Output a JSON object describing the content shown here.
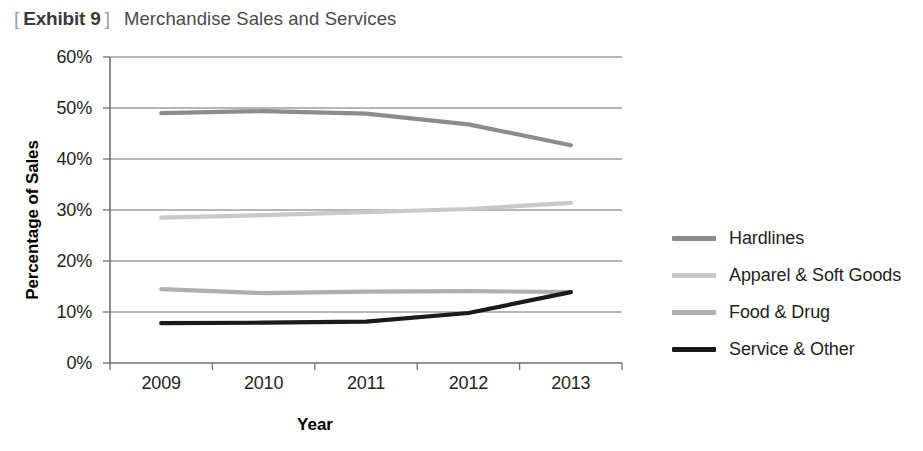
{
  "header": {
    "bracket_open": "[",
    "bracket_close": "]",
    "exhibit_label": "Exhibit 9",
    "title": "Merchandise Sales and Services"
  },
  "chart_data": {
    "type": "line",
    "title": "Merchandise Sales and Services",
    "xlabel": "Year",
    "ylabel": "Percentage of Sales",
    "categories": [
      "2009",
      "2010",
      "2011",
      "2012",
      "2013"
    ],
    "x_tick_labels": [
      "2009",
      "2010",
      "2011",
      "2012",
      "2013"
    ],
    "y_tick_labels": [
      "0%",
      "10%",
      "20%",
      "30%",
      "40%",
      "50%",
      "60%"
    ],
    "y_tick_values": [
      0,
      10,
      20,
      30,
      40,
      50,
      60
    ],
    "ylim": [
      0,
      60
    ],
    "y_unit": "%",
    "grid": true,
    "grid_axis": "y",
    "legend_position": "right",
    "series": [
      {
        "name": "Hardlines",
        "color": "#8c8c8c",
        "values": [
          49.0,
          49.4,
          48.9,
          46.8,
          42.7
        ]
      },
      {
        "name": "Apparel & Soft Goods",
        "color": "#c9c9c9",
        "values": [
          28.5,
          29.0,
          29.6,
          30.2,
          31.4
        ]
      },
      {
        "name": "Food & Drug",
        "color": "#b0b0b0",
        "values": [
          14.5,
          13.7,
          14.0,
          14.1,
          13.9
        ]
      },
      {
        "name": "Service & Other",
        "color": "#1a1a1a",
        "values": [
          7.8,
          7.9,
          8.1,
          9.8,
          13.9
        ]
      }
    ]
  },
  "colors": {
    "axis": "#6f6f6f",
    "grid": "#6f6f6f",
    "text": "#231f20",
    "exhibit_label": "#3b3b3b",
    "exhibit_title": "#4a4a4a",
    "bracket": "#9b9b9b"
  }
}
